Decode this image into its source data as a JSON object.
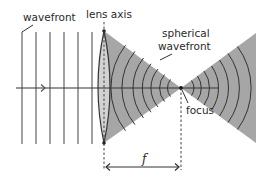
{
  "figure": {
    "labels": {
      "wavefront": "wavefront",
      "lens_axis": "lens axis",
      "spherical_line1": "spherical",
      "spherical_line2": "wavefront",
      "focus": "focus",
      "focal_length": "f"
    },
    "colors": {
      "background": "#ffffff",
      "cone_fill": "#a6a6a6",
      "lens_fill": "#d2d2d2",
      "line": "#3a3a3a",
      "plane_wavefront": "#555555"
    },
    "plane_wavefront_count": 6,
    "converging_arc_count": 7,
    "diverging_arc_count": 7
  }
}
